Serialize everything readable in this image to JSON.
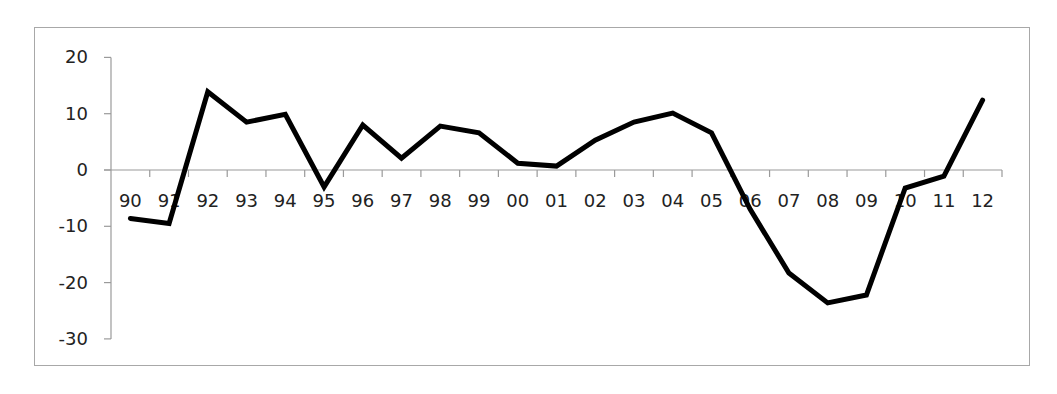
{
  "chart_data": {
    "type": "line",
    "title": "",
    "xlabel": "",
    "ylabel": "",
    "categories": [
      "90",
      "91",
      "92",
      "93",
      "94",
      "95",
      "96",
      "97",
      "98",
      "99",
      "00",
      "01",
      "02",
      "03",
      "04",
      "05",
      "06",
      "07",
      "08",
      "09",
      "10",
      "11",
      "12"
    ],
    "series": [
      {
        "name": "",
        "color": "#000000",
        "values": [
          -8.6,
          -9.5,
          13.9,
          8.5,
          9.9,
          -3.0,
          8.0,
          2.1,
          7.8,
          6.6,
          1.2,
          0.7,
          5.3,
          8.5,
          10.1,
          6.6,
          -7.0,
          -18.3,
          -23.6,
          -22.2,
          -3.2,
          -1.1,
          12.4
        ]
      }
    ],
    "ylim": [
      -30,
      20
    ],
    "yticks": [
      20,
      10,
      0,
      -10,
      -20,
      -30
    ],
    "grid": false,
    "legend": "none"
  }
}
